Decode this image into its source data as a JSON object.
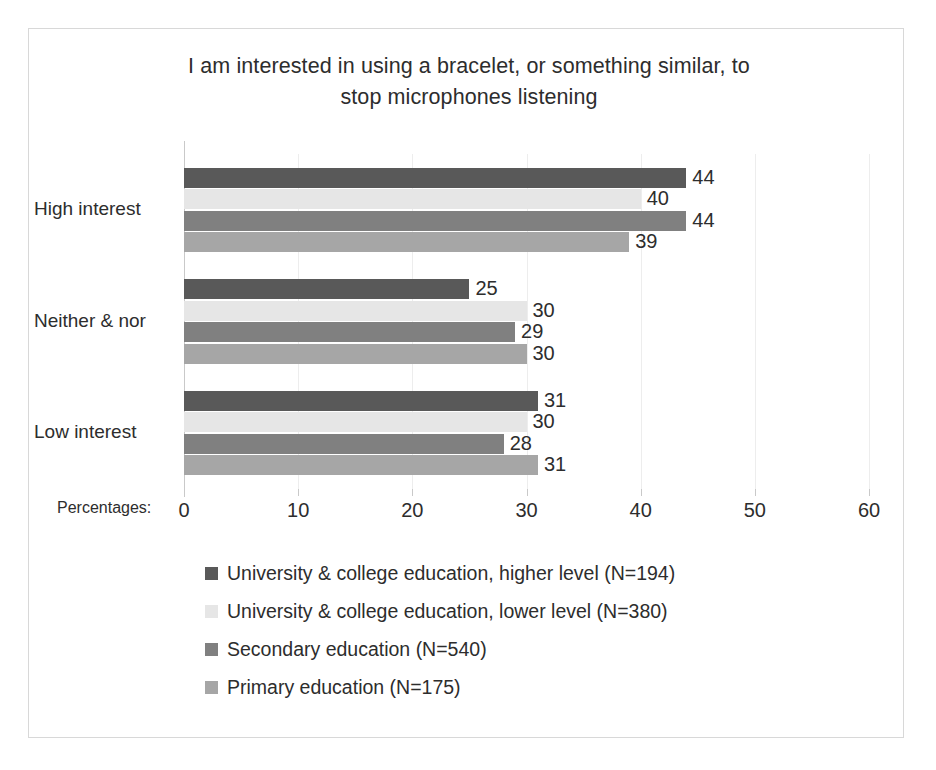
{
  "chart_data": {
    "type": "bar",
    "orientation": "horizontal",
    "title": "I am interested in using a bracelet, or something  similar, to stop microphones listening",
    "title_line1": "I am interested in using a bracelet, or something  similar, to",
    "title_line2": "stop microphones listening",
    "xlabel": "Percentages:",
    "ylabel": "",
    "categories": [
      "High interest",
      "Neither & nor",
      "Low interest"
    ],
    "xlim": [
      0,
      60
    ],
    "xticks": [
      0,
      10,
      20,
      30,
      40,
      50,
      60
    ],
    "xtick_labels": [
      "0",
      "10",
      "20",
      "30",
      "40",
      "50",
      "60"
    ],
    "grid": true,
    "legend_position": "bottom",
    "series": [
      {
        "name": "University & college education, higher level  (N=194)",
        "color": "#595959",
        "values": [
          44,
          25,
          31
        ]
      },
      {
        "name": "University & college education, lower level  (N=380)",
        "color": "#e6e6e6",
        "values": [
          40,
          30,
          30
        ]
      },
      {
        "name": "Secondary education (N=540)",
        "color": "#808080",
        "values": [
          44,
          29,
          28
        ]
      },
      {
        "name": "Primary education (N=175)",
        "color": "#a6a6a6",
        "values": [
          39,
          30,
          31
        ]
      }
    ],
    "data_labels": [
      [
        "44",
        "40",
        "44",
        "39"
      ],
      [
        "25",
        "30",
        "29",
        "30"
      ],
      [
        "31",
        "30",
        "28",
        "31"
      ]
    ]
  },
  "legend": {
    "items": [
      {
        "label": "University & college education, higher level  (N=194)",
        "color": "#595959"
      },
      {
        "label": "University & college education, lower level  (N=380)",
        "color": "#e6e6e6"
      },
      {
        "label": "Secondary education (N=540)",
        "color": "#808080"
      },
      {
        "label": "Primary education (N=175)",
        "color": "#a6a6a6"
      }
    ]
  },
  "caption": ""
}
